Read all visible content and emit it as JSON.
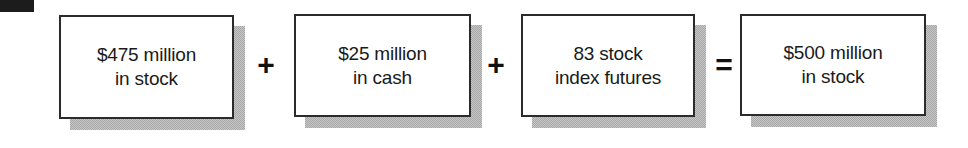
{
  "diagram": {
    "background_color": "#ffffff",
    "box_border_color": "#2b2b2b",
    "box_fill_color": "#ffffff",
    "shadow_color": "#a8a8a8",
    "text_color": "#1a1a1a",
    "artifact": {
      "name": "scan-artifact-block",
      "color": "#1c1c1c"
    },
    "terms": [
      {
        "id": "term-1",
        "line1": "$475 million",
        "line2": "in stock",
        "text": "$475 million\nin stock"
      },
      {
        "id": "term-2",
        "line1": "$25 million",
        "line2": "in cash",
        "text": "$25 million\nin cash"
      },
      {
        "id": "term-3",
        "line1": "83 stock",
        "line2": "index futures",
        "text": "83 stock\nindex futures"
      },
      {
        "id": "term-4",
        "line1": "$500 million",
        "line2": "in stock",
        "text": "$500 million\nin stock"
      }
    ],
    "operators": [
      {
        "id": "operator-1",
        "symbol": "+",
        "name": "plus"
      },
      {
        "id": "operator-2",
        "symbol": "+",
        "name": "plus"
      },
      {
        "id": "operator-3",
        "symbol": "=",
        "name": "equals"
      }
    ]
  }
}
